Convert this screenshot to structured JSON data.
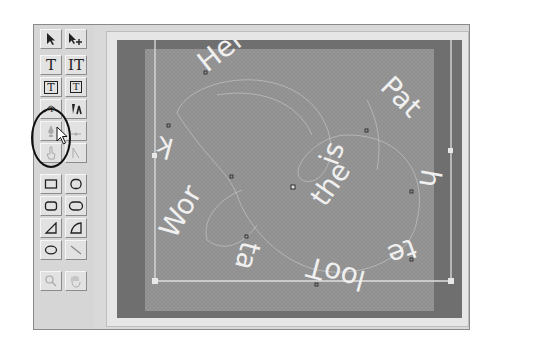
{
  "toolbox": {
    "rows": [
      {
        "left": {
          "name": "selection-arrow-tool",
          "icon": "arrow-icon"
        },
        "right": {
          "name": "add-anchor-arrow-tool",
          "icon": "arrow-plus-icon"
        }
      },
      {
        "left": {
          "name": "type-tool",
          "glyph": "T"
        },
        "right": {
          "name": "vertical-type-tool",
          "glyph": "IT"
        }
      },
      {
        "left": {
          "name": "area-type-tool",
          "glyph": "T"
        },
        "right": {
          "name": "area-vertical-type-tool",
          "glyph": "T"
        }
      },
      {
        "left": {
          "name": "path-type-tool",
          "icon": "path-type-icon"
        },
        "right": {
          "name": "vertical-path-type-tool",
          "icon": "vertical-path-type-icon"
        }
      },
      {
        "left": {
          "name": "pen-tool",
          "icon": "pen-icon",
          "disabled": true
        },
        "right": {
          "name": "add-point-tool",
          "icon": "add-point-icon",
          "disabled": true
        }
      },
      {
        "left": {
          "name": "hand-point-tool",
          "icon": "finger-icon",
          "disabled": true
        },
        "right": {
          "name": "convert-point-tool",
          "icon": "convert-point-icon",
          "disabled": true
        }
      },
      {
        "left": {
          "name": "rectangle-tool",
          "icon": "rectangle-icon"
        },
        "right": {
          "name": "rounded-square-tool",
          "icon": "rounded-square-icon"
        }
      },
      {
        "left": {
          "name": "rounded-rectangle-tool",
          "icon": "rounded-rectangle-icon"
        },
        "right": {
          "name": "oval-rectangle-tool",
          "icon": "oval-rectangle-icon"
        }
      },
      {
        "left": {
          "name": "triangle-tool",
          "icon": "triangle-icon"
        },
        "right": {
          "name": "quarter-circle-tool",
          "icon": "quarter-circle-icon"
        }
      },
      {
        "left": {
          "name": "ellipse-tool",
          "icon": "ellipse-icon"
        },
        "right": {
          "name": "line-tool",
          "icon": "line-icon"
        }
      },
      {
        "left": {
          "name": "zoom-tool",
          "icon": "magnifier-icon",
          "disabled": true
        },
        "right": {
          "name": "hand-tool",
          "icon": "hand-icon",
          "disabled": true
        }
      }
    ],
    "selected_tool": "path-type-tool"
  },
  "canvas": {
    "path_text": "Here Path the Tool at Work is",
    "words": [
      {
        "text": "Here"
      },
      {
        "text": "Pat"
      },
      {
        "text": "h"
      },
      {
        "text": "te"
      },
      {
        "text": "looT"
      },
      {
        "text": "ta"
      },
      {
        "text": "Wor"
      },
      {
        "text": "k"
      },
      {
        "text": "is"
      },
      {
        "text": "the"
      }
    ],
    "colors": {
      "frame": "#e6e6e6",
      "dark_border": "#6f6f6f",
      "canvas": "#8f8f8f",
      "text": "#f2f2f2",
      "path_line": "#c8c8c8"
    }
  }
}
